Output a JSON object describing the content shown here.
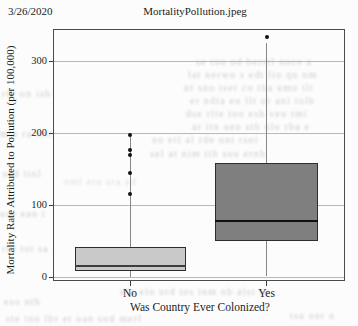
{
  "header": {
    "date": "3/26/2020",
    "title": "MortalityPollution.jpeg"
  },
  "chart_data": {
    "type": "box",
    "title": "",
    "xlabel": "Was Country Ever Colonized?",
    "ylabel": "Mortality Rate Attributed to Pollution (per 100,000)",
    "categories": [
      "No",
      "Yes"
    ],
    "yticks": [
      0,
      100,
      200,
      300
    ],
    "ylim": [
      -5,
      344
    ],
    "grid": "horizontal",
    "legend": "none",
    "series": [
      {
        "category": "No",
        "whisker_low": 0,
        "q1": 8,
        "median": 15,
        "q3": 42,
        "whisker_high": 197,
        "outliers": [
          115,
          145,
          170,
          177,
          197
        ],
        "box_color": "#c9c9c9",
        "median_color": "#3d3d3d"
      },
      {
        "category": "Yes",
        "whisker_low": 2,
        "q1": 50,
        "median": 78,
        "q3": 158,
        "whisker_high": 325,
        "outliers": [
          333
        ],
        "box_color": "#7f7f7f",
        "median_color": "#101010"
      }
    ]
  },
  "colors": {
    "frame": "#4c4c4c",
    "gridline": "#b9b9b9",
    "whisker": "#878787",
    "background": "#fcfcfc",
    "text": "#1d1d1d"
  },
  "bleedthrough": {
    "fragments": [
      "se tnu od berrtl noce a",
      "lat nerwo s edt lio qu nm",
      "nt sno tser co tha umo ilt",
      "er ndta eu llt or ani tolb",
      "dse rlie tno esb veu tmi",
      "ar itn ueo sth nlo rba e",
      "no etl al rde unt rsoi",
      "sel at nim tth sou ernb",
      "rte on isb",
      "mle ra ont",
      "sed tinl",
      "uor ean t",
      "rnl toi sa",
      "eso ntb",
      "ste ino lbr et oan sud merl",
      "nta elo urd tes inm ob alst re",
      "oml etn sra ed",
      "tsu oer n"
    ]
  }
}
